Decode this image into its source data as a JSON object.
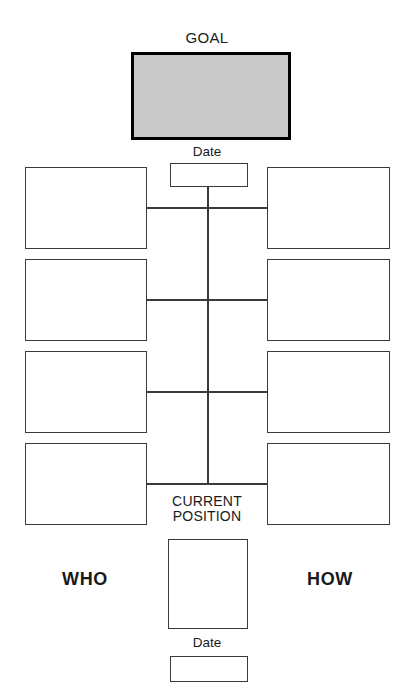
{
  "worksheet": {
    "title_label": "GOAL",
    "current_position_label": "CURRENT\nPOSITION",
    "who_label": "WHO",
    "how_label": "HOW",
    "date_top_label": "Date",
    "date_bottom_label": "Date",
    "goal_box_value": "",
    "date_top_value": "",
    "date_bottom_value": "",
    "current_position_value": "",
    "colors": {
      "goal_fill": "#c9c9c9",
      "goal_border": "#000000",
      "box_border": "#3a3a3a",
      "line": "#3a3a3a",
      "background": "#ffffff",
      "text": "#1a1a1a"
    },
    "who_steps": [
      {
        "value": ""
      },
      {
        "value": ""
      },
      {
        "value": ""
      },
      {
        "value": ""
      }
    ],
    "how_steps": [
      {
        "value": ""
      },
      {
        "value": ""
      },
      {
        "value": ""
      },
      {
        "value": ""
      }
    ]
  }
}
